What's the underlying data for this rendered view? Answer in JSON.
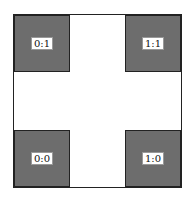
{
  "diagram": {
    "fill_color": "#6d6d6d",
    "cells": [
      {
        "position": "top-left",
        "label": "0:1"
      },
      {
        "position": "top-right",
        "label": "1:1"
      },
      {
        "position": "bottom-left",
        "label": "0:0"
      },
      {
        "position": "bottom-right",
        "label": "1:0"
      }
    ]
  }
}
